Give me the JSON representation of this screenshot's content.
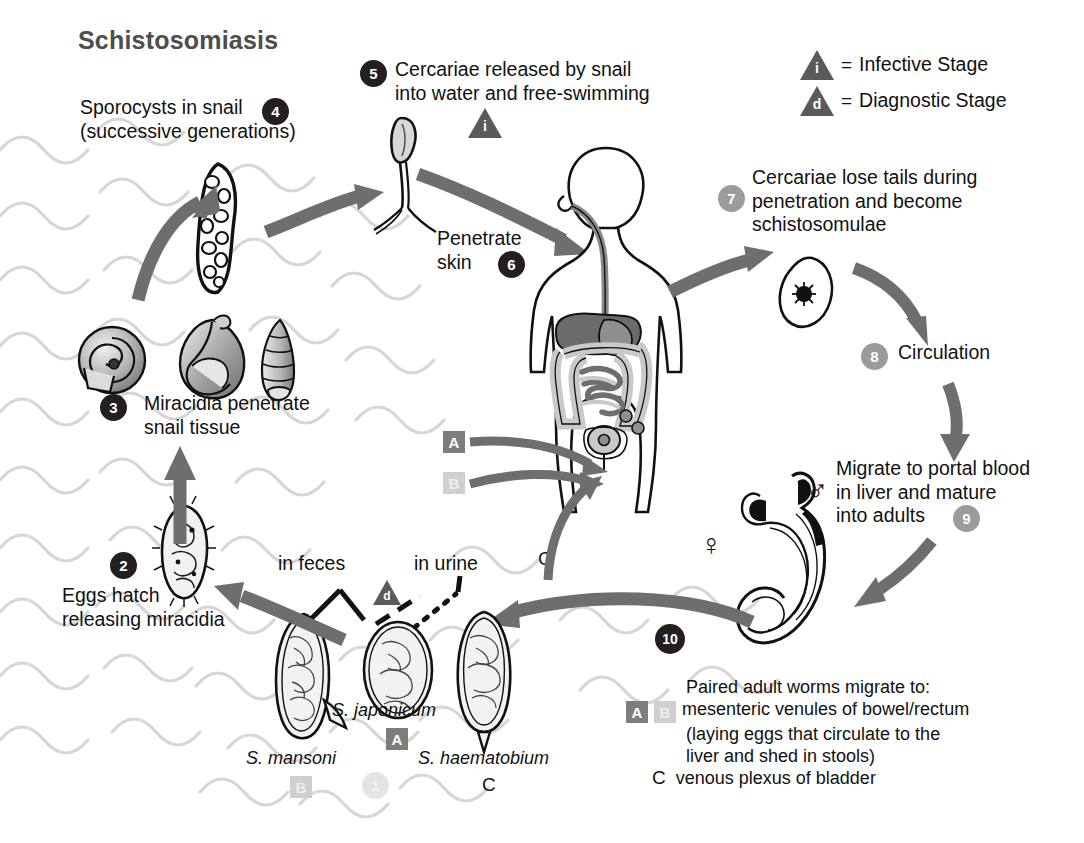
{
  "title": "Schistosomiasis",
  "legend": {
    "infective": {
      "symbol": "i",
      "equals": "=",
      "label": "Infective Stage"
    },
    "diagnostic": {
      "symbol": "d",
      "equals": "=",
      "label": "Diagnostic Stage"
    }
  },
  "steps": {
    "s1": {
      "num": "1"
    },
    "s2": {
      "num": "2",
      "text": "Eggs hatch\nreleasing miracidia"
    },
    "s3": {
      "num": "3",
      "text": "Miracidia penetrate\nsnail tissue"
    },
    "s4": {
      "num": "4",
      "text": "Sporocysts in snail\n(successive generations)"
    },
    "s5": {
      "num": "5",
      "text": "Cercariae released by snail\ninto water and free-swimming"
    },
    "s6": {
      "num": "6",
      "text": "Penetrate\nskin"
    },
    "s7": {
      "num": "7",
      "text": "Cercariae lose tails during\npenetration and become\nschistosomulae"
    },
    "s8": {
      "num": "8",
      "text": "Circulation"
    },
    "s9": {
      "num": "9",
      "text": "Migrate to portal blood\nin liver and mature\ninto adults"
    },
    "s10": {
      "num": "10"
    }
  },
  "excretion": {
    "feces": "in feces",
    "urine": "in urine",
    "diagnostic_symbol": "d"
  },
  "species": {
    "mansoni": {
      "name": "S. mansoni",
      "letter": "B"
    },
    "japonicum": {
      "name": "S. japonicum",
      "letter": "A"
    },
    "haematobium": {
      "name": "S. haematobium",
      "letter": "C"
    }
  },
  "body_markers": {
    "a": "A",
    "b": "B",
    "c": "C"
  },
  "sex_symbols": {
    "male": "♂",
    "female": "♀"
  },
  "migration_note": {
    "a": "A",
    "b": "B",
    "c": "C",
    "line1": "Paired adult worms migrate to:",
    "line2": "mesenteric venules of bowel/rectum",
    "line3": "(laying eggs that circulate to the",
    "line4": "liver and shed in stools)",
    "line5": "venous plexus of bladder"
  },
  "colors": {
    "ink": "#231f20",
    "arrow": "#6e6e6e",
    "arrow_dark": "#5c5c5c",
    "water": "#d8d8d8",
    "gray_badge": "#9b9b9b",
    "organ_dark": "#6b6b6b",
    "organ_light": "#c9c9c9"
  }
}
